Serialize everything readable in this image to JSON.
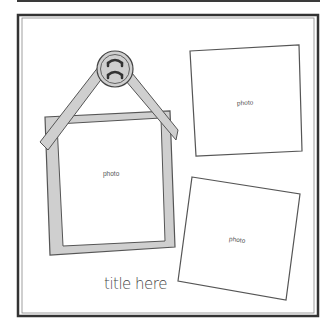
{
  "layout": {
    "photos": [
      {
        "id": "photo-1",
        "label": "photo",
        "style": "framed-hanging"
      },
      {
        "id": "photo-2",
        "label": "photo",
        "style": "plain"
      },
      {
        "id": "photo-3",
        "label": "photo",
        "style": "plain"
      }
    ],
    "title": "title here",
    "embellishment": "button-icon"
  },
  "colors": {
    "frame_border": "#333333",
    "photo_mat": "#cfcfcf",
    "outline": "#555555",
    "background": "#ffffff"
  }
}
